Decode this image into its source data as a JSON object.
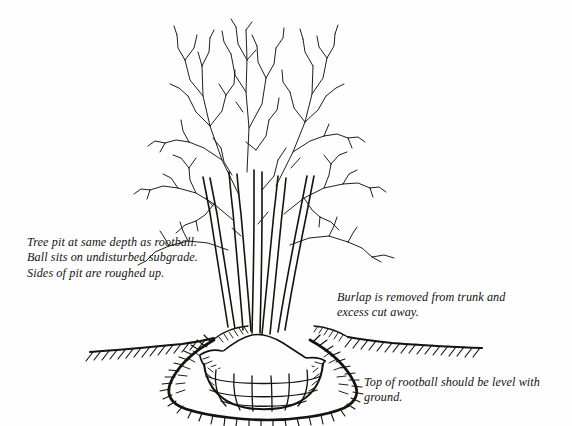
{
  "figure": {
    "type": "line-drawing",
    "background_color": "#fefefe",
    "ink_color": "#151210",
    "elements": {
      "tree": "bare-branched deciduous tree with multiple trunks",
      "ground_line": "grade line with hatching",
      "pit": "bowl shaped excavation with roughened hatched sides",
      "rootball": "rootball in wire basket with burlap",
      "mound": "soil mound / root flare at trunk base"
    }
  },
  "annotations": {
    "pit_depth": "Tree pit at same depth as rootball.\nBall sits on undisturbed subgrade.\nSides of pit are roughed up.",
    "burlap": "Burlap is removed from trunk and\nexcess cut away.",
    "rootball_level": "Top of rootball should be level with\nground."
  }
}
